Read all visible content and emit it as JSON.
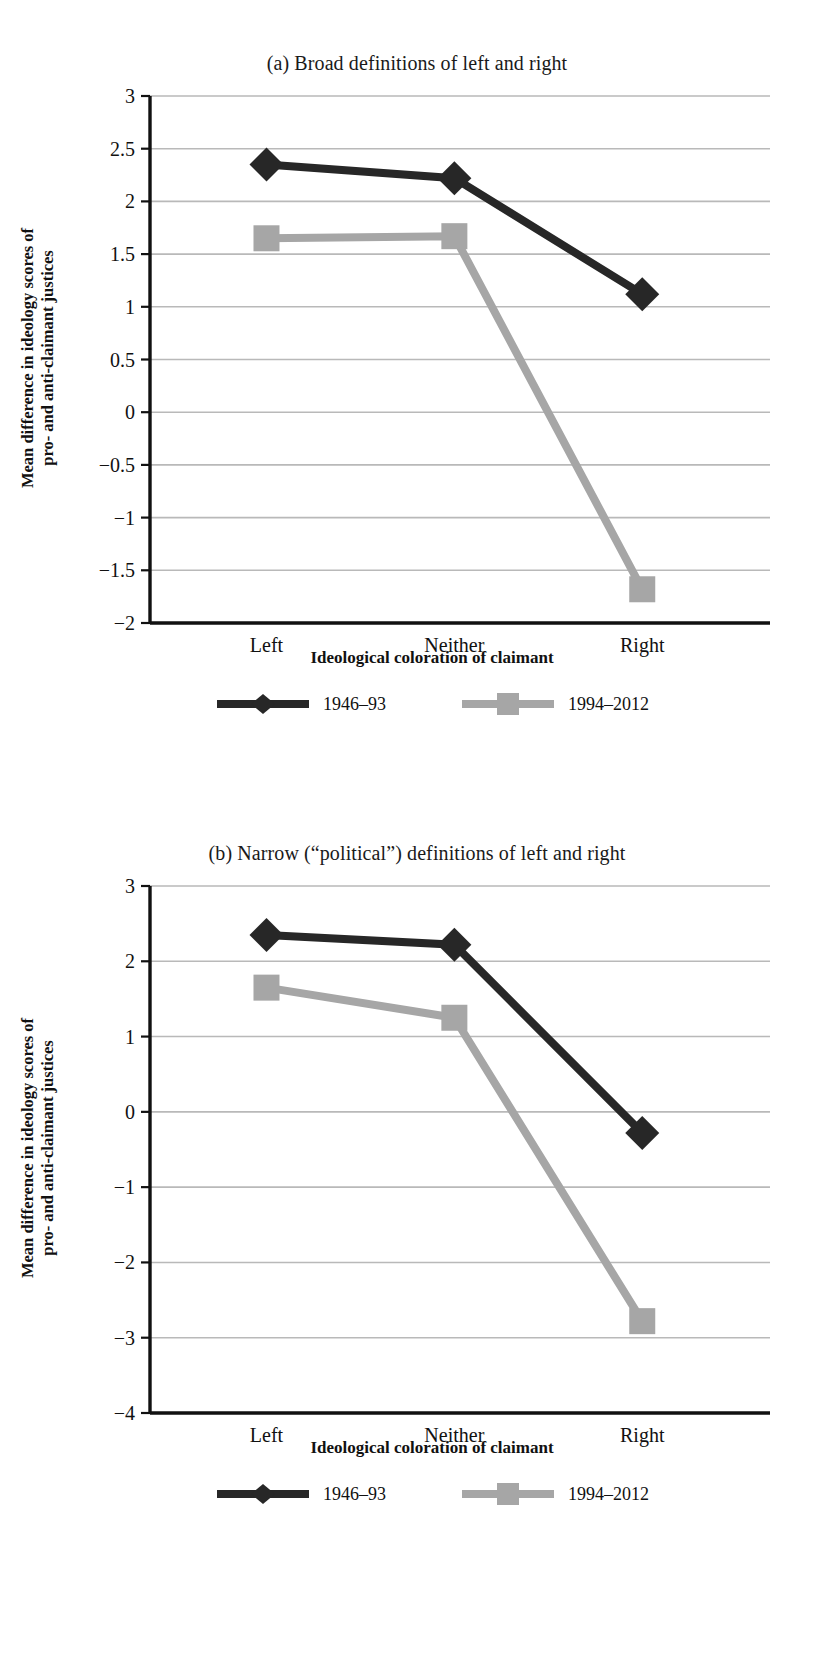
{
  "figure": {
    "ylabel_line1": "Mean difference in ideology scores of",
    "ylabel_line2": "pro- and anti-claimant justices",
    "xlabel": "Ideological coloration of claimant",
    "legend": [
      {
        "label": "1946–93",
        "marker": "diamond",
        "color": "#272727"
      },
      {
        "label": "1994–2012",
        "marker": "square",
        "color": "#a6a6a6"
      }
    ]
  },
  "chart_data": [
    {
      "type": "line",
      "title": "(a) Broad definitions of left and right",
      "panel": "a",
      "categories": [
        "Left",
        "Neither",
        "Right"
      ],
      "series": [
        {
          "name": "1946–93",
          "marker": "diamond",
          "color": "#272727",
          "values": [
            2.35,
            2.22,
            1.12
          ]
        },
        {
          "name": "1994–2012",
          "marker": "square",
          "color": "#a6a6a6",
          "values": [
            1.65,
            1.67,
            -1.68
          ]
        }
      ],
      "xlabel": "Ideological coloration of claimant",
      "ylabel": "Mean difference in ideology scores of pro- and anti-claimant justices",
      "ylim": [
        -2,
        3
      ],
      "yticks": [
        "3",
        "2.5",
        "2",
        "1.5",
        "1",
        "0.5",
        "0",
        "−0.5",
        "−1",
        "−1.5",
        "−2"
      ],
      "ytick_values": [
        3,
        2.5,
        2,
        1.5,
        1,
        0.5,
        0,
        -0.5,
        -1,
        -1.5,
        -2
      ],
      "grid": true,
      "legend_position": "bottom"
    },
    {
      "type": "line",
      "title": "(b) Narrow (“political”) definitions of left and right",
      "panel": "b",
      "categories": [
        "Left",
        "Neither",
        "Right"
      ],
      "series": [
        {
          "name": "1946–93",
          "marker": "diamond",
          "color": "#272727",
          "values": [
            2.35,
            2.22,
            -0.28
          ]
        },
        {
          "name": "1994–2012",
          "marker": "square",
          "color": "#a6a6a6",
          "values": [
            1.65,
            1.25,
            -2.78
          ]
        }
      ],
      "xlabel": "Ideological coloration of claimant",
      "ylabel": "Mean difference in ideology scores of pro- and anti-claimant justices",
      "ylim": [
        -4,
        3
      ],
      "yticks": [
        "3",
        "2",
        "1",
        "0",
        "−1",
        "−2",
        "−3",
        "−4"
      ],
      "ytick_values": [
        3,
        2,
        1,
        0,
        -1,
        -2,
        -3,
        -4
      ],
      "grid": true,
      "legend_position": "bottom"
    }
  ]
}
